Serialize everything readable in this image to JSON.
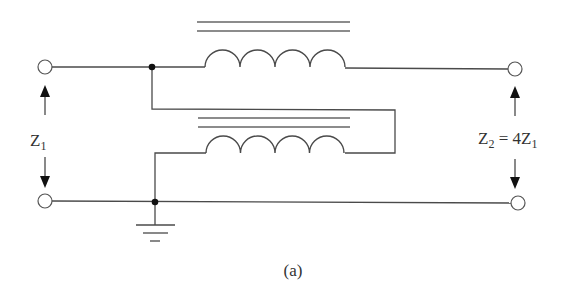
{
  "figure": {
    "caption": "(a)",
    "type": "autotransformer / transmission-line transformer schematic",
    "colors": {
      "line": "#4a4a4a",
      "dot": "#111111",
      "background": "#ffffff"
    }
  },
  "labels": {
    "input_impedance": {
      "main": "Z",
      "sub": "1"
    },
    "output_impedance": {
      "main1": "Z",
      "sub1": "2",
      "eq": " = 4Z",
      "sub2": "1"
    }
  },
  "components": {
    "upper_winding": {
      "turns": 4,
      "core_lines": 2
    },
    "lower_winding": {
      "turns": 4,
      "core_lines": 2
    },
    "terminals": [
      "input-top",
      "input-bottom",
      "output-top",
      "output-bottom"
    ],
    "junction_dots": 2,
    "ground": true
  }
}
